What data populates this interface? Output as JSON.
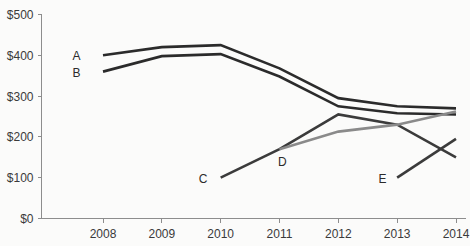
{
  "chart_data": {
    "type": "line",
    "title": "",
    "subtitle": "",
    "xlabel": "",
    "ylabel": "",
    "x": [
      2008,
      2009,
      2010,
      2011,
      2012,
      2013,
      2014
    ],
    "categories": [
      "2008",
      "2009",
      "2010",
      "2011",
      "2012",
      "2013",
      "2014"
    ],
    "xlim": [
      2008,
      2014
    ],
    "ylim": [
      0,
      500
    ],
    "y_ticks": [
      0,
      100,
      200,
      300,
      400,
      500
    ],
    "y_tick_labels": [
      "$0",
      "$100",
      "$200",
      "$300",
      "$400",
      "$500"
    ],
    "x_tick_labels": [
      "2008",
      "2009",
      "2010",
      "2011",
      "2012",
      "2013",
      "2014"
    ],
    "grid": false,
    "legend": "inline-labels",
    "series": [
      {
        "name": "A",
        "color": "#2b2b2b",
        "width": 2.6,
        "x": [
          2008,
          2009,
          2010,
          2011,
          2012,
          2013,
          2014
        ],
        "values": [
          400,
          420,
          425,
          368,
          295,
          275,
          270
        ],
        "label": "A",
        "label_x": 2007.55,
        "label_y": 400
      },
      {
        "name": "B",
        "color": "#2b2b2b",
        "width": 2.6,
        "x": [
          2008,
          2009,
          2010,
          2011,
          2012,
          2013,
          2014
        ],
        "values": [
          360,
          398,
          403,
          348,
          275,
          258,
          255
        ],
        "label": "B",
        "label_x": 2007.55,
        "label_y": 358
      },
      {
        "name": "C",
        "color": "#3b3b3b",
        "width": 2.6,
        "x": [
          2010,
          2011,
          2012,
          2013,
          2014
        ],
        "values": [
          100,
          170,
          255,
          230,
          150
        ],
        "label": "C",
        "label_x": 2009.7,
        "label_y": 98
      },
      {
        "name": "D",
        "color": "#8a8a8a",
        "width": 2.6,
        "x": [
          2011,
          2012,
          2013,
          2014
        ],
        "values": [
          170,
          213,
          230,
          262
        ],
        "label": "D",
        "label_x": 2011.05,
        "label_y": 140
      },
      {
        "name": "E",
        "color": "#3b3b3b",
        "width": 2.6,
        "x": [
          2013,
          2014
        ],
        "values": [
          100,
          195
        ],
        "label": "E",
        "label_x": 2012.75,
        "label_y": 98
      }
    ]
  },
  "axes": {
    "axis_color": "#8d8d8d",
    "text_color": "#3a3a3a"
  }
}
